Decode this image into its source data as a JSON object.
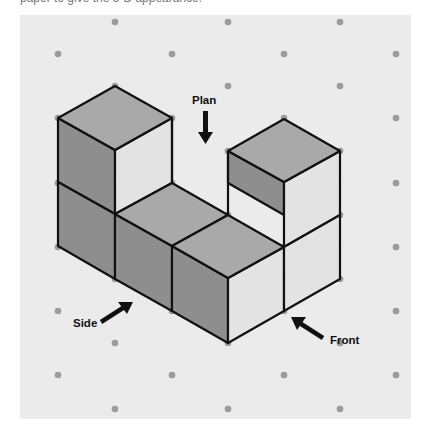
{
  "caption": "paper to give the 3-D appearance.",
  "colors": {
    "panel": "#ebebeb",
    "dot": "#9b9b9b",
    "top_face": "#a9a9a9",
    "left_face": "#8e8e8e",
    "right_face": "#e3e3e3",
    "edge": "#111111"
  },
  "labels": {
    "plan": "Plan",
    "side": "Side",
    "front": "Front"
  },
  "diagram": {
    "cube_count": 5
  }
}
